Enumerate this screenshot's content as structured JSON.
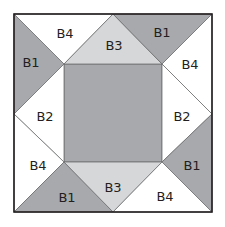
{
  "colors": {
    "B1": "#a7a9ac",
    "B2": "#ffffff",
    "B3": "#d6d7d9",
    "B4": "#ffffff",
    "center": "#a7a9ac",
    "outline": "#231f20",
    "seam": "#6d6e70"
  },
  "center": {
    "label": ""
  },
  "pieces": [
    {
      "id": "top-left-left",
      "label": "B1"
    },
    {
      "id": "top-left-top",
      "label": "B4"
    },
    {
      "id": "top-mid",
      "label": "B3"
    },
    {
      "id": "top-right-top",
      "label": "B1"
    },
    {
      "id": "top-right-right",
      "label": "B4"
    },
    {
      "id": "mid-left",
      "label": "B2"
    },
    {
      "id": "mid-right",
      "label": "B2"
    },
    {
      "id": "bottom-left-left",
      "label": "B4"
    },
    {
      "id": "bottom-left-bottom",
      "label": "B1"
    },
    {
      "id": "bottom-mid",
      "label": "B3"
    },
    {
      "id": "bottom-right-right",
      "label": "B1"
    },
    {
      "id": "bottom-right-bottom",
      "label": "B4"
    }
  ]
}
